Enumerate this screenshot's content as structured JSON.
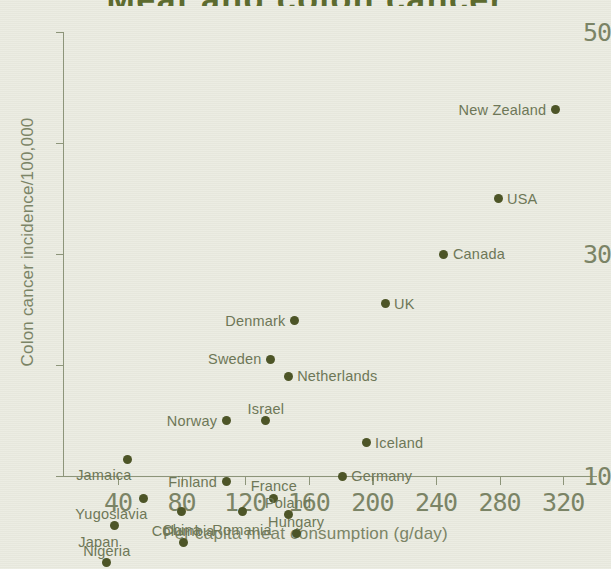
{
  "chart_data": {
    "type": "scatter",
    "title": "Meat and colon cancer",
    "xlabel": "Per capita meat consumption (g/day)",
    "ylabel": "Colon cancer incidence/100,000",
    "xlim": [
      22,
      330
    ],
    "ylim": [
      1,
      50
    ],
    "xticks": [
      40,
      80,
      120,
      160,
      200,
      240,
      280,
      320
    ],
    "yticks_major": [
      10,
      30,
      50
    ],
    "yticks_minor": [
      20,
      40
    ],
    "grid": false,
    "legend": "none",
    "point_color": "#4d5527",
    "axis_color": "#8d957a",
    "text_color": "#7b8466",
    "background_color": "#e9eadf",
    "points": [
      {
        "label": "New Zealand",
        "x": 315,
        "y": 43.0,
        "label_pos": "left"
      },
      {
        "label": "USA",
        "x": 279,
        "y": 35.0,
        "label_pos": "right"
      },
      {
        "label": "Canada",
        "x": 245,
        "y": 30.0,
        "label_pos": "right"
      },
      {
        "label": "UK",
        "x": 208,
        "y": 25.5,
        "label_pos": "right"
      },
      {
        "label": "Denmark",
        "x": 151,
        "y": 24.0,
        "label_pos": "left"
      },
      {
        "label": "Sweden",
        "x": 136,
        "y": 20.5,
        "label_pos": "left"
      },
      {
        "label": "Netherlands",
        "x": 147,
        "y": 19.0,
        "label_pos": "right"
      },
      {
        "label": "Israel",
        "x": 133,
        "y": 15.0,
        "label_pos": "above"
      },
      {
        "label": "Norway",
        "x": 108,
        "y": 15.0,
        "label_pos": "left"
      },
      {
        "label": "Iceland",
        "x": 196,
        "y": 13.0,
        "label_pos": "right"
      },
      {
        "label": "Jamaica",
        "x": 46,
        "y": 11.5,
        "label_pos": "below-left"
      },
      {
        "label": "Germany",
        "x": 181,
        "y": 10.0,
        "label_pos": "right"
      },
      {
        "label": "Finland",
        "x": 108,
        "y": 9.5,
        "label_pos": "left"
      },
      {
        "label": "France",
        "x": 138,
        "y": 8.0,
        "label_pos": "above"
      },
      {
        "label": "Yugoslavia",
        "x": 56,
        "y": 8.0,
        "label_pos": "below-left"
      },
      {
        "label": "Poland",
        "x": 147,
        "y": 6.5,
        "label_pos": "above"
      },
      {
        "label": "China",
        "x": 80,
        "y": 6.8,
        "label_pos": "below"
      },
      {
        "label": "Romania",
        "x": 118,
        "y": 6.8,
        "label_pos": "below"
      },
      {
        "label": "Japan",
        "x": 38,
        "y": 5.5,
        "label_pos": "below-left"
      },
      {
        "label": "Hungary",
        "x": 152,
        "y": 4.8,
        "label_pos": "above"
      },
      {
        "label": "Columbia",
        "x": 81,
        "y": 4.0,
        "label_pos": "above"
      },
      {
        "label": "Nigeria",
        "x": 33,
        "y": 2.2,
        "label_pos": "above"
      }
    ]
  }
}
